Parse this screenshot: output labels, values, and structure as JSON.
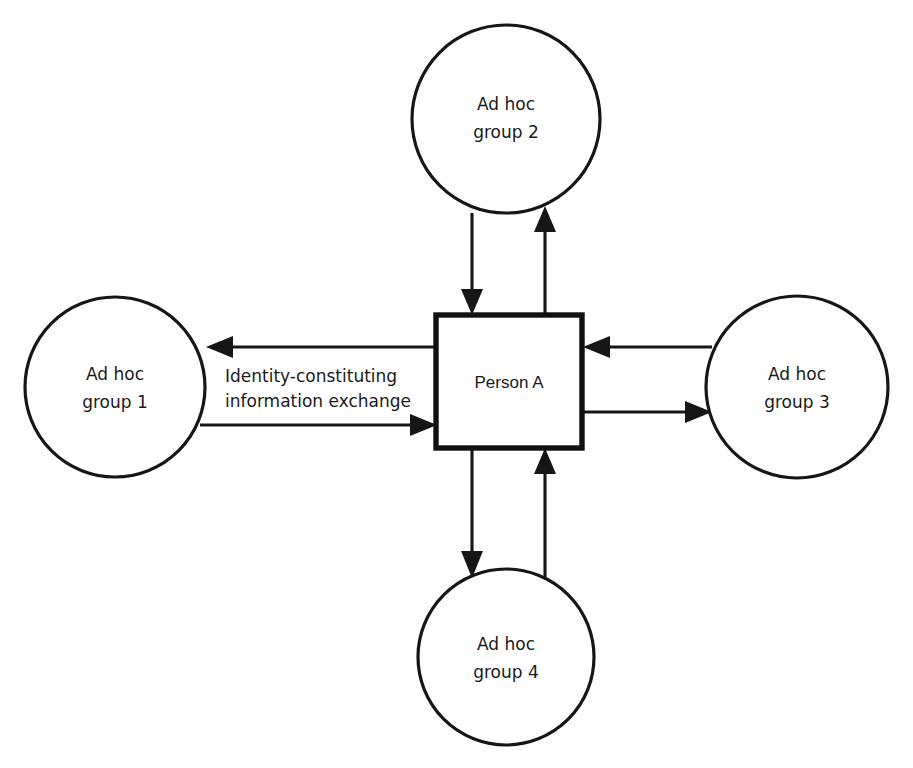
{
  "diagram": {
    "type": "hub-and-spoke node-link diagram",
    "background_color": "#ffffff",
    "stroke_color": "#161616",
    "center_node": {
      "id": "person-a",
      "shape": "square",
      "label": "Person A",
      "stroke_width_px": 5.4,
      "x": 436,
      "y": 315,
      "width": 146,
      "height": 133
    },
    "nodes": [
      {
        "id": "ad-hoc-group-1",
        "shape": "circle",
        "position": "left",
        "label_line1": "Ad hoc",
        "label_line2": "group 1",
        "cx": 115,
        "cy": 387,
        "r": 90
      },
      {
        "id": "ad-hoc-group-2",
        "shape": "circle",
        "position": "top",
        "label_line1": "Ad hoc",
        "label_line2": "group 2",
        "cx": 506,
        "cy": 119,
        "r": 94
      },
      {
        "id": "ad-hoc-group-3",
        "shape": "circle",
        "position": "right",
        "label_line1": "Ad hoc",
        "label_line2": "group 3",
        "cx": 797,
        "cy": 387,
        "r": 91
      },
      {
        "id": "ad-hoc-group-4",
        "shape": "circle",
        "position": "bottom",
        "label_line1": "Ad hoc",
        "label_line2": "group 4",
        "cx": 506,
        "cy": 657,
        "r": 88
      }
    ],
    "edge_label": {
      "id": "identity-constituting-information-exchange",
      "line1": "Identity-constituting",
      "line2": "information exchange",
      "x": 225,
      "y_line1": 377,
      "y_line2": 402
    },
    "edges": [
      {
        "id": "person-a-to-group-1",
        "from": "person-a",
        "to": "ad-hoc-group-1",
        "direction": "outbound",
        "orientation": "horizontal",
        "arrow": "left"
      },
      {
        "id": "group-1-to-person-a",
        "from": "ad-hoc-group-1",
        "to": "person-a",
        "direction": "inbound",
        "orientation": "horizontal",
        "arrow": "right"
      },
      {
        "id": "group-2-to-person-a",
        "from": "ad-hoc-group-2",
        "to": "person-a",
        "direction": "inbound",
        "orientation": "vertical",
        "arrow": "down"
      },
      {
        "id": "person-a-to-group-2",
        "from": "person-a",
        "to": "ad-hoc-group-2",
        "direction": "outbound",
        "orientation": "vertical",
        "arrow": "up"
      },
      {
        "id": "group-3-to-person-a",
        "from": "ad-hoc-group-3",
        "to": "person-a",
        "direction": "inbound",
        "orientation": "horizontal",
        "arrow": "left"
      },
      {
        "id": "person-a-to-group-3",
        "from": "person-a",
        "to": "ad-hoc-group-3",
        "direction": "outbound",
        "orientation": "horizontal",
        "arrow": "right"
      },
      {
        "id": "person-a-to-group-4",
        "from": "person-a",
        "to": "ad-hoc-group-4",
        "direction": "outbound",
        "orientation": "vertical",
        "arrow": "down"
      },
      {
        "id": "group-4-to-person-a",
        "from": "ad-hoc-group-4",
        "to": "person-a",
        "direction": "inbound",
        "orientation": "vertical",
        "arrow": "up"
      }
    ]
  }
}
